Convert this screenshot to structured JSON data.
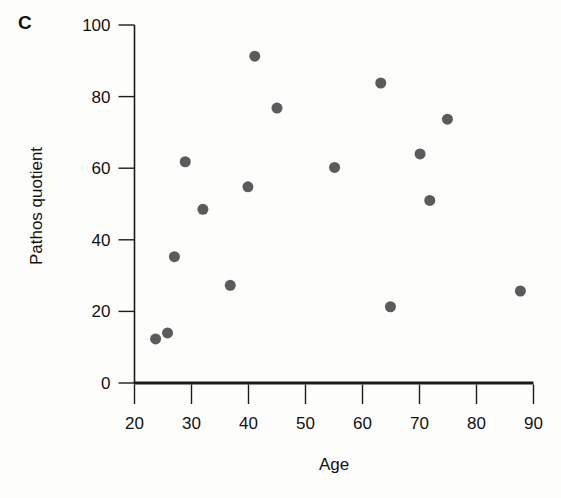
{
  "figure": {
    "panel_letter": "C",
    "background_color": "#fdfdfc",
    "axis_color": "#1b1b1b",
    "point_color": "#5b5b5b"
  },
  "chart_data": {
    "type": "scatter",
    "title": "",
    "panel_label": "C",
    "xlabel": "Age",
    "ylabel": "Pathos quotient",
    "xlim": [
      20,
      90
    ],
    "ylim": [
      0,
      100
    ],
    "xticks": [
      20,
      30,
      40,
      50,
      60,
      70,
      80,
      90
    ],
    "yticks": [
      0,
      20,
      40,
      60,
      80,
      100
    ],
    "xtick_labels": [
      "20",
      "30",
      "40",
      "50",
      "60",
      "70",
      "80",
      "90"
    ],
    "ytick_labels": [
      "0",
      "20",
      "40",
      "60",
      "80",
      "100"
    ],
    "grid": false,
    "legend": false,
    "marker": "circle",
    "marker_color": "#5b5b5b",
    "marker_size": 11,
    "series": [
      {
        "name": "participants",
        "points": [
          {
            "x": 23.7,
            "y": 12.3
          },
          {
            "x": 25.8,
            "y": 14.0
          },
          {
            "x": 27.0,
            "y": 35.3
          },
          {
            "x": 28.9,
            "y": 61.8
          },
          {
            "x": 32.0,
            "y": 48.5
          },
          {
            "x": 36.8,
            "y": 27.3
          },
          {
            "x": 39.9,
            "y": 54.8
          },
          {
            "x": 41.1,
            "y": 91.3
          },
          {
            "x": 45.0,
            "y": 76.8
          },
          {
            "x": 55.1,
            "y": 60.2
          },
          {
            "x": 63.2,
            "y": 83.8
          },
          {
            "x": 64.9,
            "y": 21.3
          },
          {
            "x": 70.1,
            "y": 64.0
          },
          {
            "x": 71.8,
            "y": 51.0
          },
          {
            "x": 74.9,
            "y": 73.7
          },
          {
            "x": 87.7,
            "y": 25.7
          }
        ]
      }
    ]
  }
}
